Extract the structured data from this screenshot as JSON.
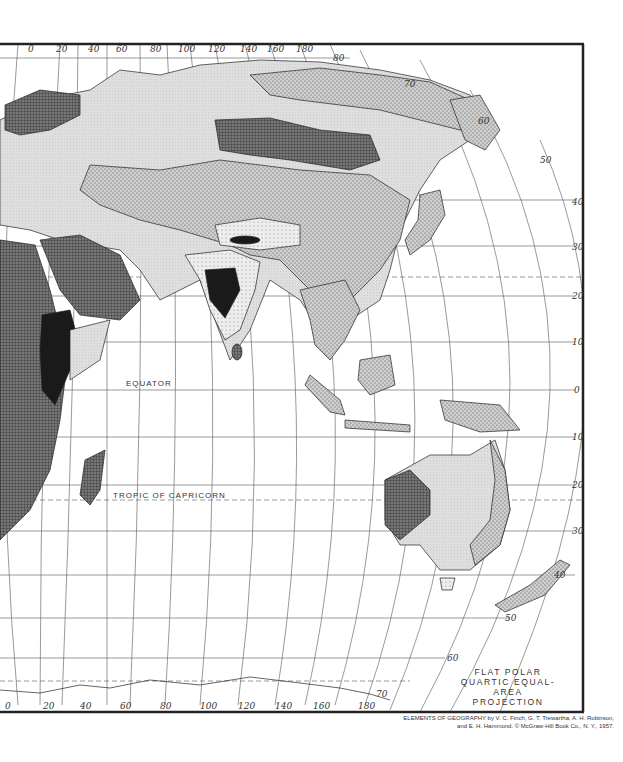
{
  "map": {
    "title_lines": [
      "FLAT POLAR",
      "QUARTIC EQUAL-AREA",
      "PROJECTION"
    ],
    "credit_lines": [
      "ELEMENTS OF GEOGRAPHY by V. C. Finch, G. T. Trewartha, A. H. Robinson,",
      "and E. H. Hammond.     © McGraw-Hill  Book Co., N. Y., 1957."
    ],
    "labels": {
      "equator": "EQUATOR",
      "tropic_of_capricorn": "TROPIC OF CAPRICORN"
    },
    "top_longitudes": [
      "0",
      "20",
      "40",
      "60",
      "80",
      "100",
      "120",
      "140",
      "160",
      "180"
    ],
    "bottom_longitudes": [
      "0",
      "20",
      "40",
      "60",
      "80",
      "100",
      "120",
      "140",
      "160",
      "180"
    ],
    "right_latitudes_north": [
      "80",
      "70",
      "60",
      "50",
      "40",
      "30",
      "20",
      "10",
      "0"
    ],
    "right_latitudes_south": [
      "10",
      "20",
      "30",
      "40",
      "50",
      "60",
      "70"
    ],
    "colors": {
      "ink": "#333333",
      "dark_fill": "#1a1a1a",
      "crosshatch": "#555555",
      "stipple": "#999999",
      "light": "#d8d8d8",
      "paper": "#ffffff"
    }
  }
}
